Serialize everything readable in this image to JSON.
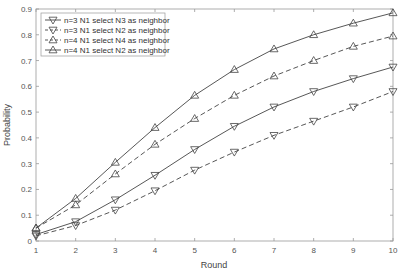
{
  "chart_data": {
    "type": "line",
    "title": "",
    "xlabel": "Round",
    "ylabel": "Probability",
    "xlim": [
      1,
      10
    ],
    "ylim": [
      0,
      0.9
    ],
    "x": [
      1,
      2,
      3,
      4,
      5,
      6,
      7,
      8,
      9,
      10
    ],
    "xticks": [
      "1",
      "2",
      "3",
      "4",
      "5",
      "6",
      "7",
      "8",
      "9",
      "10"
    ],
    "yticks": [
      "0",
      "0.1",
      "0.2",
      "0.3",
      "0.4",
      "0.5",
      "0.6",
      "0.7",
      "0.8",
      "0.9"
    ],
    "grid": false,
    "legend_position": "upper-left",
    "series": [
      {
        "name": "n=3 N1 select N3 as neighbor",
        "marker": "triangle-down",
        "line": "solid",
        "values": [
          0.025,
          0.075,
          0.16,
          0.255,
          0.355,
          0.445,
          0.52,
          0.58,
          0.63,
          0.675
        ]
      },
      {
        "name": "n=3 N1 select N2 as neighbor",
        "marker": "triangle-down",
        "line": "dashed",
        "values": [
          0.02,
          0.06,
          0.12,
          0.195,
          0.275,
          0.345,
          0.41,
          0.465,
          0.52,
          0.58
        ]
      },
      {
        "name": "n=4 N1 select N4 as neighbor",
        "marker": "triangle-up",
        "line": "dashed",
        "values": [
          0.05,
          0.14,
          0.26,
          0.375,
          0.475,
          0.565,
          0.64,
          0.7,
          0.755,
          0.795
        ]
      },
      {
        "name": "n=4 N1 select N2 as neighbor",
        "marker": "triangle-up",
        "line": "solid",
        "values": [
          0.05,
          0.165,
          0.305,
          0.44,
          0.565,
          0.665,
          0.745,
          0.8,
          0.845,
          0.885
        ]
      }
    ]
  }
}
